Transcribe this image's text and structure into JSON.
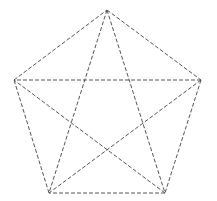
{
  "diagram": {
    "type": "complete-graph-k5",
    "background": "#ffffff",
    "stroke_color": "#555555",
    "stroke_width": 1,
    "dash_pattern": "4 2",
    "vertices": [
      {
        "id": "top",
        "x": 107,
        "y": 10
      },
      {
        "id": "right",
        "x": 201,
        "y": 80
      },
      {
        "id": "bottom-right",
        "x": 165,
        "y": 193
      },
      {
        "id": "bottom-left",
        "x": 49,
        "y": 193
      },
      {
        "id": "left",
        "x": 14,
        "y": 80
      }
    ],
    "edges": [
      {
        "from": "top",
        "to": "right",
        "kind": "side"
      },
      {
        "from": "right",
        "to": "bottom-right",
        "kind": "side"
      },
      {
        "from": "bottom-right",
        "to": "bottom-left",
        "kind": "side"
      },
      {
        "from": "bottom-left",
        "to": "left",
        "kind": "side"
      },
      {
        "from": "left",
        "to": "top",
        "kind": "side"
      },
      {
        "from": "top",
        "to": "bottom-right",
        "kind": "diagonal"
      },
      {
        "from": "top",
        "to": "bottom-left",
        "kind": "diagonal"
      },
      {
        "from": "right",
        "to": "left",
        "kind": "diagonal"
      },
      {
        "from": "right",
        "to": "bottom-left",
        "kind": "diagonal"
      },
      {
        "from": "bottom-right",
        "to": "left",
        "kind": "diagonal"
      }
    ]
  }
}
